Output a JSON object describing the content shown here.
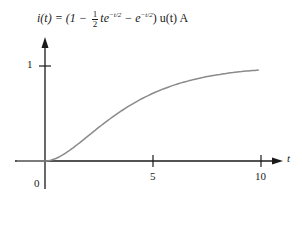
{
  "title": {
    "lhs": "i(t) = (1 − ",
    "frac_num": "1",
    "frac_den": "2",
    "term1": "te",
    "exp1": "−t/2",
    "minus": " − e",
    "exp2": "−t/2",
    "rhs": ") u(t) A"
  },
  "axes": {
    "x_label": "t",
    "x_ticks": [
      "0",
      "5",
      "10"
    ],
    "y_ticks": [
      "1"
    ]
  },
  "colors": {
    "axis": "#1a1a1a",
    "curve": "#8a8a8a"
  },
  "chart_data": {
    "type": "line",
    "xlabel": "t",
    "ylabel": "",
    "xlim": [
      -1.3,
      10.7
    ],
    "ylim": [
      0,
      1.4
    ],
    "x_ticks": [
      0,
      5,
      10
    ],
    "y_ticks": [
      1
    ],
    "grid": false,
    "legend": null,
    "series": [
      {
        "name": "i(t)",
        "x": [
          -1.3,
          0,
          0.5,
          1,
          1.5,
          2,
          2.5,
          3,
          3.5,
          4,
          4.5,
          5,
          5.5,
          6,
          6.5,
          7,
          7.5,
          8,
          8.5,
          9,
          9.5,
          10
        ],
        "y": [
          0,
          0,
          0.026,
          0.09,
          0.173,
          0.264,
          0.355,
          0.442,
          0.522,
          0.594,
          0.657,
          0.713,
          0.76,
          0.801,
          0.835,
          0.864,
          0.888,
          0.908,
          0.925,
          0.939,
          0.95,
          0.96
        ]
      }
    ]
  }
}
